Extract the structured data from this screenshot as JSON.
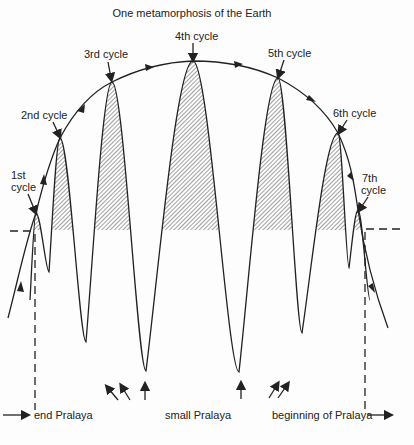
{
  "title": "One metamorphosis of the Earth",
  "cycles": [
    {
      "label": "1st",
      "label2": "cycle"
    },
    {
      "label": "2nd cycle"
    },
    {
      "label": "3rd cycle"
    },
    {
      "label": "4th cycle"
    },
    {
      "label": "5th cycle"
    },
    {
      "label": "6th cycle"
    },
    {
      "label": "7th",
      "label2": "cycle"
    }
  ],
  "bottom_labels": {
    "end": "end Pralaya",
    "small": "small Pralaya",
    "beginning": "beginning of Pralaya"
  },
  "colors": {
    "ink": "#222222",
    "hatch": "#555555",
    "background": "#fdfdfd"
  }
}
